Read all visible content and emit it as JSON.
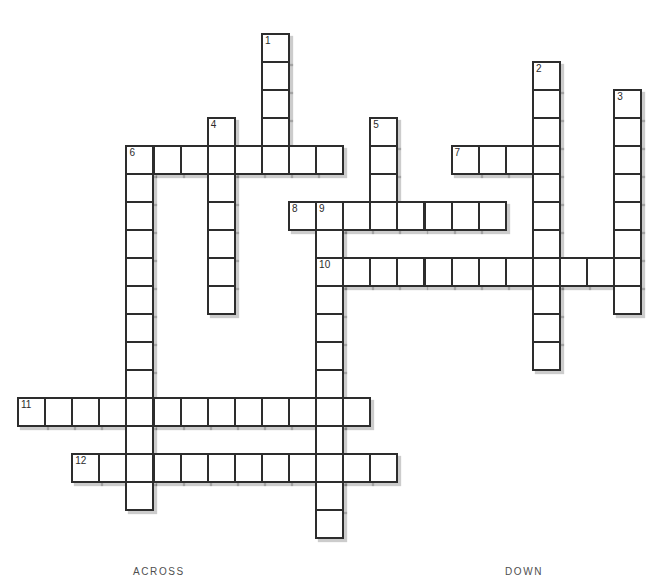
{
  "labels": {
    "across": "ACROSS",
    "down": "DOWN"
  },
  "style": {
    "background": "#ffffff",
    "grid_line_color": "#2d2d2d",
    "cell_fill": "#ffffff",
    "shadow_color": "rgba(0,0,0,0.20)",
    "number_color": "#2a2a2a",
    "heading_color": "#4f4f4f"
  },
  "puzzle": {
    "rows": 18,
    "cols": 23,
    "numbers_visible": [
      "1",
      "2",
      "3",
      "4",
      "5",
      "6",
      "7",
      "8",
      "9",
      "10",
      "11",
      "12"
    ],
    "entries": [
      {
        "number": 1,
        "direction": "down",
        "row": 0,
        "col": 9,
        "length": 5
      },
      {
        "number": 2,
        "direction": "down",
        "row": 1,
        "col": 19,
        "length": 11
      },
      {
        "number": 3,
        "direction": "down",
        "row": 2,
        "col": 22,
        "length": 8
      },
      {
        "number": 4,
        "direction": "down",
        "row": 3,
        "col": 7,
        "length": 7
      },
      {
        "number": 5,
        "direction": "down",
        "row": 3,
        "col": 13,
        "length": 4
      },
      {
        "number": 6,
        "direction": "across",
        "row": 4,
        "col": 4,
        "length": 8
      },
      {
        "number": 6,
        "direction": "down",
        "row": 4,
        "col": 4,
        "length": 13
      },
      {
        "number": 7,
        "direction": "across",
        "row": 4,
        "col": 16,
        "length": 4
      },
      {
        "number": 8,
        "direction": "across",
        "row": 6,
        "col": 10,
        "length": 8
      },
      {
        "number": 9,
        "direction": "down",
        "row": 6,
        "col": 11,
        "length": 12
      },
      {
        "number": 10,
        "direction": "across",
        "row": 8,
        "col": 11,
        "length": 12
      },
      {
        "number": 11,
        "direction": "across",
        "row": 13,
        "col": 0,
        "length": 13
      },
      {
        "number": 12,
        "direction": "across",
        "row": 15,
        "col": 2,
        "length": 12
      }
    ]
  }
}
